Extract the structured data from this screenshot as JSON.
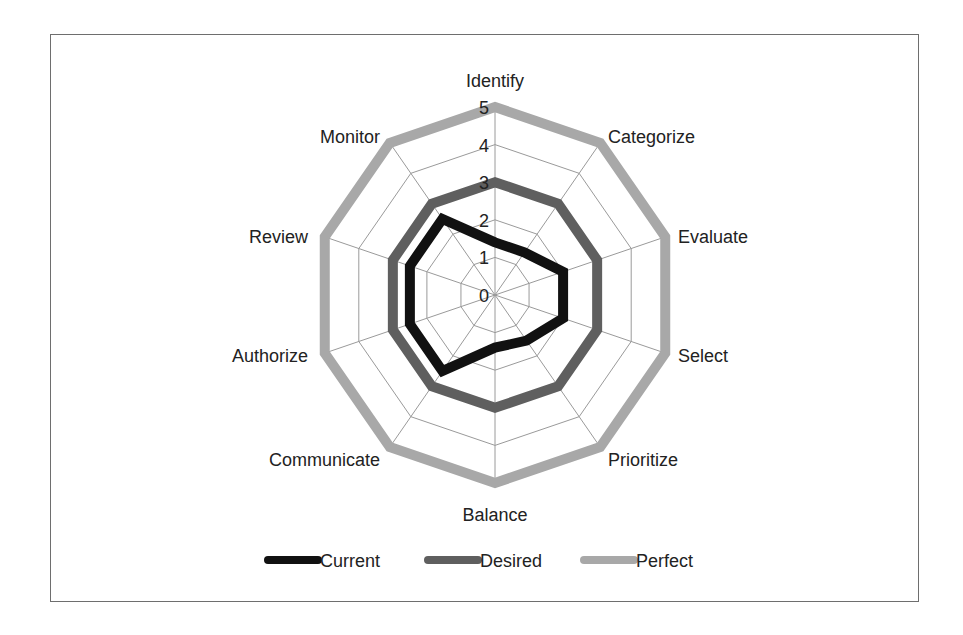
{
  "chart_data": {
    "type": "radar",
    "title": "",
    "categories": [
      "Identify",
      "Categorize",
      "Evaluate",
      "Select",
      "Prioritize",
      "Balance",
      "Communicate",
      "Authorize",
      "Review",
      "Monitor"
    ],
    "series": [
      {
        "name": "Current",
        "values": [
          1.4,
          1.4,
          2,
          2,
          1.5,
          1.4,
          2.5,
          2.5,
          2.5,
          2.5
        ],
        "color": "#111111"
      },
      {
        "name": "Desired",
        "values": [
          3,
          3,
          3,
          3,
          3,
          3,
          3,
          3,
          3,
          3
        ],
        "color": "#5f5f5f"
      },
      {
        "name": "Perfect",
        "values": [
          5,
          5,
          5,
          5,
          5,
          5,
          5,
          5,
          5,
          5
        ],
        "color": "#a8a8a8"
      }
    ],
    "rlim": [
      0,
      5
    ],
    "ticks": [
      "0",
      "1",
      "2",
      "3",
      "4",
      "5"
    ],
    "grid": true,
    "legend_position": "bottom"
  },
  "colors": {
    "grid": "#9a9a9a",
    "frame": "#6e6e6e",
    "text": "#222222"
  }
}
